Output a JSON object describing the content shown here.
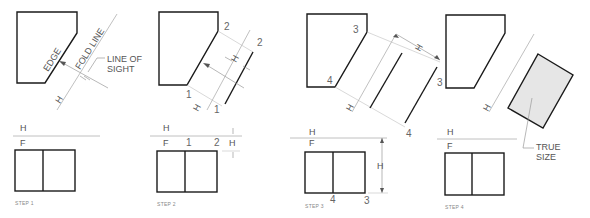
{
  "figure": {
    "type": "descriptive-geometry-steps",
    "steps": [
      {
        "label": "STEP 1",
        "annotations": {
          "edge": "EDGE",
          "fold_line": "FOLD LINE",
          "line_of_sight": "LINE OF SIGHT",
          "line_of_sight_l1": "LINE OF",
          "line_of_sight_l2": "SIGHT",
          "h": "H"
        },
        "front_view": {
          "top_label": "H",
          "bottom_label": "F"
        }
      },
      {
        "label": "STEP 2",
        "annotations": {
          "point_1": "1",
          "point_2": "2",
          "h": "H"
        },
        "front_view": {
          "top_label": "H",
          "bottom_label": "F",
          "point_1": "1",
          "point_2": "2",
          "h": "H"
        }
      },
      {
        "label": "STEP 3",
        "annotations": {
          "point_3": "3",
          "point_4": "4",
          "h": "H"
        },
        "front_view": {
          "top_label": "H",
          "bottom_label": "F",
          "point_4": "4",
          "point_3": "3",
          "h": "H"
        }
      },
      {
        "label": "STEP 4",
        "annotations": {
          "true_size_l1": "TRUE",
          "true_size_l2": "SIZE",
          "h": "H"
        },
        "front_view": {
          "top_label": "H",
          "bottom_label": "F"
        }
      }
    ]
  }
}
